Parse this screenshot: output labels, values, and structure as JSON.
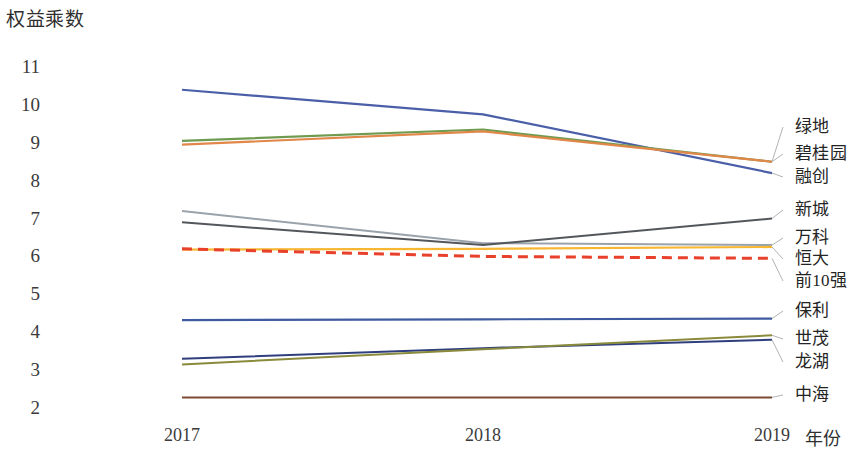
{
  "chart_data": {
    "type": "line",
    "title": "",
    "ylabel": "权益乘数",
    "xlabel": "年份",
    "categories": [
      "2017",
      "2018",
      "2019"
    ],
    "x": [
      2017,
      2018,
      2019
    ],
    "ylim": [
      2,
      11
    ],
    "yticks": [
      "11",
      "10",
      "9",
      "8",
      "7",
      "6",
      "5",
      "4",
      "3",
      "2"
    ],
    "grid": false,
    "legend_position": "right-inline",
    "series": [
      {
        "name": "融创",
        "values": [
          10.4,
          9.75,
          8.2
        ],
        "color": "#4a5fa8",
        "dash": "none",
        "width": 2.2
      },
      {
        "name": "绿地",
        "values": [
          9.05,
          9.35,
          8.5
        ],
        "color": "#6e9b4f",
        "dash": "none",
        "width": 2.2
      },
      {
        "name": "碧桂园",
        "values": [
          8.95,
          9.3,
          8.5
        ],
        "color": "#e08749",
        "dash": "none",
        "width": 2.2
      },
      {
        "name": "万科",
        "values": [
          7.2,
          6.35,
          6.3
        ],
        "color": "#9aa3ab",
        "dash": "none",
        "width": 2.0
      },
      {
        "name": "新城",
        "values": [
          6.9,
          6.3,
          7.0
        ],
        "color": "#53575c",
        "dash": "none",
        "width": 2.0
      },
      {
        "name": "恒大",
        "values": [
          6.18,
          6.2,
          6.25
        ],
        "color": "#f7b733",
        "dash": "none",
        "width": 2.2
      },
      {
        "name": "前10强",
        "values": [
          6.2,
          6.0,
          5.95
        ],
        "color": "#e8402a",
        "dash": "10,6",
        "width": 3.0
      },
      {
        "name": "保利",
        "values": [
          4.32,
          4.34,
          4.36
        ],
        "color": "#3f5ba0",
        "dash": "none",
        "width": 2.2
      },
      {
        "name": "龙湖",
        "values": [
          3.3,
          3.58,
          3.8
        ],
        "color": "#2f3f7d",
        "dash": "none",
        "width": 2.0
      },
      {
        "name": "世茂",
        "values": [
          3.15,
          3.55,
          3.92
        ],
        "color": "#8a8a3c",
        "dash": "none",
        "width": 2.0
      },
      {
        "name": "中海",
        "values": [
          2.28,
          2.28,
          2.28
        ],
        "color": "#7a4a32",
        "dash": "none",
        "width": 2.0
      }
    ],
    "annotations": [
      {
        "label": "绿地",
        "y": 127
      },
      {
        "label": "碧桂园",
        "y": 154
      },
      {
        "label": "融创",
        "y": 177
      },
      {
        "label": "新城",
        "y": 210
      },
      {
        "label": "万科",
        "y": 238
      },
      {
        "label": "恒大",
        "y": 259
      },
      {
        "label": "前10强",
        "y": 281
      },
      {
        "label": "保利",
        "y": 311
      },
      {
        "label": "世茂",
        "y": 339
      },
      {
        "label": "龙湖",
        "y": 362
      },
      {
        "label": "中海",
        "y": 395
      }
    ]
  },
  "axes": {
    "y_title": "权益乘数",
    "x_title": "年份",
    "y_ticks": [
      "11",
      "10",
      "9",
      "8",
      "7",
      "6",
      "5",
      "4",
      "3",
      "2"
    ],
    "x_ticks": [
      "2017",
      "2018",
      "2019"
    ]
  }
}
